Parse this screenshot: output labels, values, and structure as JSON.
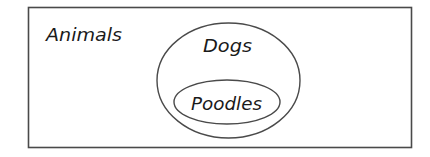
{
  "diagram": {
    "type": "euler-venn",
    "stroke_color": "#4a4a4a",
    "text_color": "#1a1a1a",
    "background_color": "#ffffff",
    "universe": {
      "label": "Animals",
      "shape": "rectangle"
    },
    "sets": [
      {
        "label": "Dogs",
        "shape": "ellipse",
        "contained_in": "Animals"
      },
      {
        "label": "Poodles",
        "shape": "ellipse",
        "contained_in": "Dogs"
      }
    ]
  }
}
